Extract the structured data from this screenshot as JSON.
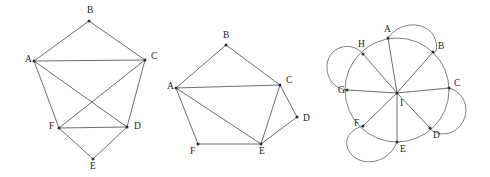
{
  "figure": {
    "background_color": "#ffffff",
    "edge_color": "#55555a",
    "loop_color": "#6a6a70",
    "vertex_color": "#2e2e33",
    "label_color": "#1d1d21"
  },
  "graphs": [
    {
      "id": "graph-left",
      "name": "left-graph",
      "vertices": [
        {
          "label": "A",
          "x": 34,
          "y": 61,
          "lx": 25,
          "ly": 60
        },
        {
          "label": "B",
          "x": 89,
          "y": 21,
          "lx": 87,
          "ly": 11
        },
        {
          "label": "C",
          "x": 145,
          "y": 60,
          "lx": 151,
          "ly": 57
        },
        {
          "label": "D",
          "x": 127,
          "y": 127,
          "lx": 134,
          "ly": 127
        },
        {
          "label": "E",
          "x": 93,
          "y": 159,
          "lx": 90,
          "ly": 167
        },
        {
          "label": "F",
          "x": 59,
          "y": 128,
          "lx": 49,
          "ly": 127
        }
      ],
      "edges": [
        [
          "A",
          "B"
        ],
        [
          "B",
          "C"
        ],
        [
          "A",
          "C"
        ],
        [
          "A",
          "F"
        ],
        [
          "A",
          "D"
        ],
        [
          "C",
          "F"
        ],
        [
          "C",
          "D"
        ],
        [
          "F",
          "D"
        ],
        [
          "F",
          "E"
        ],
        [
          "D",
          "E"
        ]
      ]
    },
    {
      "id": "graph-middle",
      "name": "middle-graph",
      "vertices": [
        {
          "label": "A",
          "x": 176,
          "y": 88,
          "lx": 167,
          "ly": 87
        },
        {
          "label": "B",
          "x": 226,
          "y": 45,
          "lx": 223,
          "ly": 36
        },
        {
          "label": "C",
          "x": 280,
          "y": 85,
          "lx": 286,
          "ly": 81
        },
        {
          "label": "D",
          "x": 297,
          "y": 117,
          "lx": 303,
          "ly": 119
        },
        {
          "label": "E",
          "x": 261,
          "y": 144,
          "lx": 259,
          "ly": 152
        },
        {
          "label": "F",
          "x": 198,
          "y": 144,
          "lx": 190,
          "ly": 152
        }
      ],
      "edges": [
        [
          "A",
          "B"
        ],
        [
          "B",
          "C"
        ],
        [
          "A",
          "C"
        ],
        [
          "A",
          "E"
        ],
        [
          "A",
          "F"
        ],
        [
          "C",
          "E"
        ],
        [
          "C",
          "D"
        ],
        [
          "D",
          "E"
        ],
        [
          "F",
          "E"
        ]
      ]
    },
    {
      "id": "graph-right",
      "name": "right-graph-wheel",
      "center": {
        "label": "I",
        "x": 397,
        "y": 93,
        "lx": 400,
        "ly": 104
      },
      "ring": {
        "cx": 397,
        "cy": 90,
        "rx": 52,
        "ry": 52,
        "rotation": 0
      },
      "vertices": [
        {
          "label": "A",
          "x": 388,
          "y": 38,
          "lx": 384,
          "ly": 30
        },
        {
          "label": "B",
          "x": 433,
          "y": 52,
          "lx": 438,
          "ly": 47
        },
        {
          "label": "C",
          "x": 449,
          "y": 88,
          "lx": 454,
          "ly": 84
        },
        {
          "label": "D",
          "x": 430,
          "y": 128,
          "lx": 433,
          "ly": 136
        },
        {
          "label": "E",
          "x": 397,
          "y": 142,
          "lx": 400,
          "ly": 150
        },
        {
          "label": "F",
          "x": 363,
          "y": 126,
          "lx": 354,
          "ly": 124
        },
        {
          "label": "G",
          "x": 347,
          "y": 90,
          "lx": 338,
          "ly": 91
        },
        {
          "label": "H",
          "x": 363,
          "y": 54,
          "lx": 358,
          "ly": 45
        }
      ],
      "spokes": [
        [
          "I",
          "A"
        ],
        [
          "I",
          "B"
        ],
        [
          "I",
          "C"
        ],
        [
          "I",
          "D"
        ],
        [
          "I",
          "E"
        ],
        [
          "I",
          "F"
        ],
        [
          "I",
          "G"
        ],
        [
          "I",
          "H"
        ]
      ],
      "loops": [
        {
          "name": "loop-a-b",
          "from": "A",
          "to": "B",
          "path": "M 388 38 C 402 18, 432 22, 436 42 C 438 52, 434 54, 433 52"
        },
        {
          "name": "loop-c-d",
          "from": "C",
          "to": "D",
          "path": "M 449 88 C 470 94, 472 122, 452 132 C 440 137, 431 131, 430 128"
        },
        {
          "name": "loop-e-f",
          "from": "E",
          "to": "F",
          "path": "M 397 142 C 388 166, 356 168, 348 149 C 342 134, 358 127, 363 126"
        },
        {
          "name": "loop-g-h",
          "from": "G",
          "to": "H",
          "path": "M 347 90 C 324 88, 320 56, 339 48 C 352 43, 361 51, 363 54"
        }
      ]
    }
  ]
}
